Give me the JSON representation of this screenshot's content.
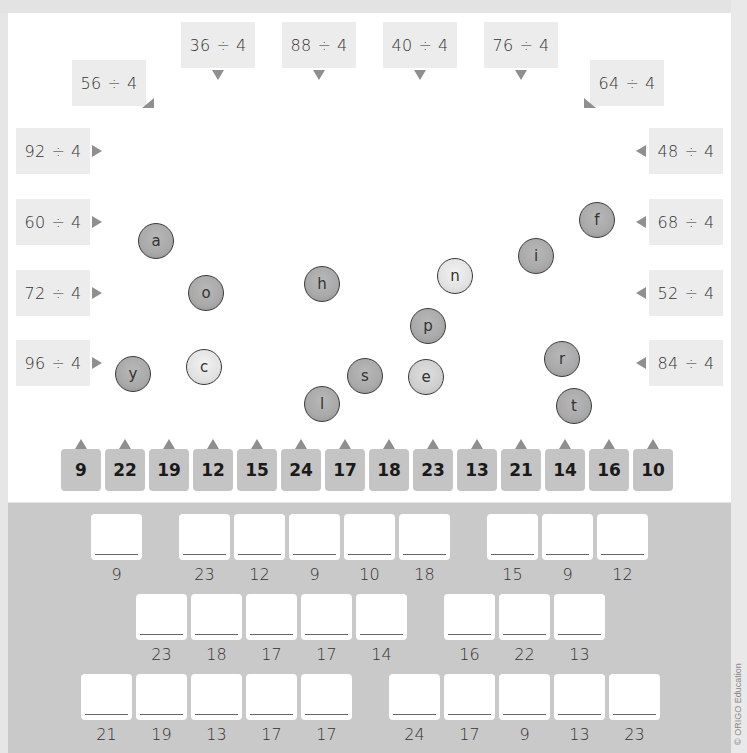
{
  "header": {
    "cut_text_fragments": [
      "'",
      "9",
      "()"
    ]
  },
  "top_questions": [
    {
      "id": "q56",
      "text": "56 ÷ 4",
      "x": 72,
      "y": 60,
      "arrow": "diag-r"
    },
    {
      "id": "q36",
      "text": "36 ÷ 4",
      "x": 181,
      "y": 22,
      "arrow": "down"
    },
    {
      "id": "q88",
      "text": "88 ÷ 4",
      "x": 282,
      "y": 22,
      "arrow": "down"
    },
    {
      "id": "q40",
      "text": "40 ÷ 4",
      "x": 383,
      "y": 22,
      "arrow": "down"
    },
    {
      "id": "q76",
      "text": "76 ÷ 4",
      "x": 484,
      "y": 22,
      "arrow": "down"
    },
    {
      "id": "q64",
      "text": "64 ÷ 4",
      "x": 590,
      "y": 60,
      "arrow": "diag-l"
    }
  ],
  "left_questions": [
    {
      "id": "q92",
      "text": "92 ÷ 4",
      "y": 128
    },
    {
      "id": "q60",
      "text": "60 ÷ 4",
      "y": 199
    },
    {
      "id": "q72",
      "text": "72 ÷ 4",
      "y": 270
    },
    {
      "id": "q96",
      "text": "96 ÷ 4",
      "y": 340
    }
  ],
  "right_questions": [
    {
      "id": "q48",
      "text": "48 ÷ 4",
      "y": 128
    },
    {
      "id": "q68",
      "text": "68 ÷ 4",
      "y": 199
    },
    {
      "id": "q52",
      "text": "52 ÷ 4",
      "y": 270
    },
    {
      "id": "q84",
      "text": "84 ÷ 4",
      "y": 340
    }
  ],
  "bubbles": [
    {
      "letter": "a",
      "x": 138,
      "y": 223,
      "shade": "dark"
    },
    {
      "letter": "o",
      "x": 188,
      "y": 275,
      "shade": "dark"
    },
    {
      "letter": "y",
      "x": 115,
      "y": 356,
      "shade": "dark"
    },
    {
      "letter": "c",
      "x": 186,
      "y": 349,
      "shade": "light"
    },
    {
      "letter": "h",
      "x": 304,
      "y": 266,
      "shade": "dark"
    },
    {
      "letter": "l",
      "x": 304,
      "y": 386,
      "shade": "dark"
    },
    {
      "letter": "s",
      "x": 347,
      "y": 358,
      "shade": "dark"
    },
    {
      "letter": "p",
      "x": 410,
      "y": 308,
      "shade": "dark"
    },
    {
      "letter": "e",
      "x": 408,
      "y": 359,
      "shade": "mid"
    },
    {
      "letter": "n",
      "x": 437,
      "y": 258,
      "shade": "light"
    },
    {
      "letter": "i",
      "x": 518,
      "y": 238,
      "shade": "dark"
    },
    {
      "letter": "f",
      "x": 579,
      "y": 202,
      "shade": "dark"
    },
    {
      "letter": "r",
      "x": 544,
      "y": 341,
      "shade": "dark"
    },
    {
      "letter": "t",
      "x": 556,
      "y": 388,
      "shade": "dark"
    }
  ],
  "number_tiles": [
    "9",
    "22",
    "19",
    "12",
    "15",
    "24",
    "17",
    "18",
    "23",
    "13",
    "21",
    "14",
    "16",
    "10"
  ],
  "answer_rows": [
    {
      "x": 91,
      "y": 514,
      "groups": [
        [
          "9"
        ],
        [
          "23",
          "12",
          "9",
          "10",
          "18"
        ],
        [
          "15",
          "9",
          "12"
        ]
      ],
      "gaps": [
        37,
        37
      ]
    },
    {
      "x": 136,
      "y": 594,
      "groups": [
        [
          "23",
          "18",
          "17",
          "17",
          "14"
        ],
        [
          "16",
          "22",
          "13"
        ]
      ],
      "gaps": [
        37
      ]
    },
    {
      "x": 81,
      "y": 674,
      "groups": [
        [
          "21",
          "19",
          "13",
          "17",
          "17"
        ],
        [
          "24",
          "17",
          "9",
          "13",
          "23"
        ]
      ],
      "gaps": [
        37
      ]
    }
  ],
  "footer": {
    "copyright": "© ORIGO Education"
  }
}
